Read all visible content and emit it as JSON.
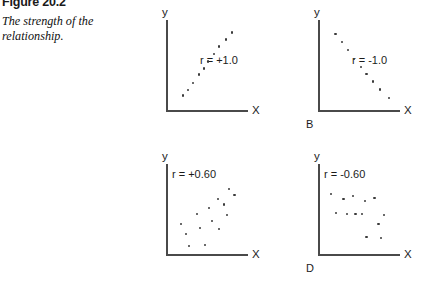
{
  "figure": {
    "number": "Figure 20.2",
    "caption": "The strength of the relationship."
  },
  "axes": {
    "y_label": "y",
    "x_label": "X"
  },
  "chart_data": [
    {
      "type": "scatter",
      "panel": "A",
      "panel_letter": "",
      "annotation": "r = +1.0",
      "correlation": 1.0,
      "title": "",
      "xlabel": "X",
      "ylabel": "y",
      "xlim": [
        0,
        100
      ],
      "ylim": [
        0,
        100
      ],
      "grid": false,
      "points": [
        {
          "x": 18,
          "y": 16
        },
        {
          "x": 25,
          "y": 22
        },
        {
          "x": 31,
          "y": 30
        },
        {
          "x": 38,
          "y": 40
        },
        {
          "x": 45,
          "y": 47
        },
        {
          "x": 50,
          "y": 55
        },
        {
          "x": 57,
          "y": 63
        },
        {
          "x": 64,
          "y": 72
        },
        {
          "x": 72,
          "y": 80
        },
        {
          "x": 80,
          "y": 88
        }
      ]
    },
    {
      "type": "scatter",
      "panel": "B",
      "panel_letter": "B",
      "annotation": "r = -1.0",
      "correlation": -1.0,
      "title": "",
      "xlabel": "X",
      "ylabel": "y",
      "xlim": [
        0,
        100
      ],
      "ylim": [
        0,
        100
      ],
      "grid": false,
      "points": [
        {
          "x": 19,
          "y": 86
        },
        {
          "x": 27,
          "y": 77
        },
        {
          "x": 35,
          "y": 68
        },
        {
          "x": 42,
          "y": 58
        },
        {
          "x": 51,
          "y": 49
        },
        {
          "x": 58,
          "y": 41
        },
        {
          "x": 66,
          "y": 32
        },
        {
          "x": 75,
          "y": 23
        },
        {
          "x": 86,
          "y": 13
        }
      ]
    },
    {
      "type": "scatter",
      "panel": "C",
      "panel_letter": "",
      "annotation": "r = +0.60",
      "correlation": 0.6,
      "title": "",
      "xlabel": "X",
      "ylabel": "y",
      "xlim": [
        0,
        100
      ],
      "ylim": [
        0,
        100
      ],
      "grid": false,
      "points": [
        {
          "x": 16,
          "y": 34
        },
        {
          "x": 22,
          "y": 22
        },
        {
          "x": 26,
          "y": 9
        },
        {
          "x": 36,
          "y": 45
        },
        {
          "x": 40,
          "y": 29
        },
        {
          "x": 46,
          "y": 10
        },
        {
          "x": 51,
          "y": 52
        },
        {
          "x": 55,
          "y": 37
        },
        {
          "x": 62,
          "y": 62
        },
        {
          "x": 64,
          "y": 28
        },
        {
          "x": 70,
          "y": 56
        },
        {
          "x": 74,
          "y": 44
        },
        {
          "x": 76,
          "y": 74
        },
        {
          "x": 83,
          "y": 67
        }
      ]
    },
    {
      "type": "scatter",
      "panel": "D",
      "panel_letter": "D",
      "annotation": "r = -0.60",
      "correlation": -0.6,
      "title": "",
      "xlabel": "X",
      "ylabel": "y",
      "xlim": [
        0,
        100
      ],
      "ylim": [
        0,
        100
      ],
      "grid": false,
      "points": [
        {
          "x": 13,
          "y": 68
        },
        {
          "x": 20,
          "y": 46
        },
        {
          "x": 29,
          "y": 62
        },
        {
          "x": 33,
          "y": 45
        },
        {
          "x": 41,
          "y": 66
        },
        {
          "x": 44,
          "y": 45
        },
        {
          "x": 52,
          "y": 45
        },
        {
          "x": 56,
          "y": 60
        },
        {
          "x": 58,
          "y": 19
        },
        {
          "x": 68,
          "y": 63
        },
        {
          "x": 73,
          "y": 34
        },
        {
          "x": 76,
          "y": 18
        },
        {
          "x": 80,
          "y": 44
        }
      ]
    }
  ]
}
